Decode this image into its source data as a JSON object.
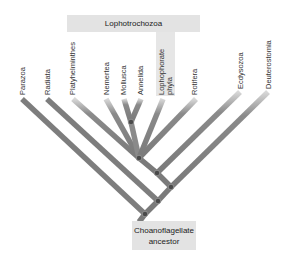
{
  "diagram": {
    "type": "phylogenetic-tree",
    "clade_label": "Lophotrochozoa",
    "root_label_line1": "Choanoflagellate",
    "root_label_line2": "ancestor",
    "taxa": [
      {
        "name": "Parazoa"
      },
      {
        "name": "Radiata"
      },
      {
        "name": "Platyhelminthes"
      },
      {
        "name": "Nemertea"
      },
      {
        "name": "Mollusca"
      },
      {
        "name": "Annelida"
      },
      {
        "name": "Lophophorate phyla",
        "line1": "Lophophorate",
        "line2": "phyla"
      },
      {
        "name": "Rotifera"
      },
      {
        "name": "Ecdysozoa"
      },
      {
        "name": "Deuterostomia"
      }
    ],
    "colors": {
      "branch": "#7a7a7a",
      "node": "#4a4a4a",
      "label_box": "#e3e3e3"
    }
  }
}
